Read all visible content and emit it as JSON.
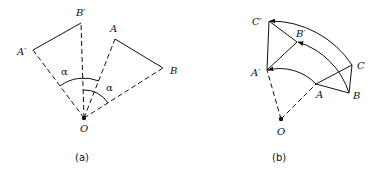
{
  "diagram_a": {
    "caption": "(a)",
    "labels": {
      "O": "O",
      "A": "A",
      "B": "B",
      "A_prime": "A′",
      "B_prime": "B′",
      "alpha_outer": "α",
      "alpha_inner": "α"
    }
  },
  "diagram_b": {
    "caption": "(b)",
    "labels": {
      "O": "O",
      "A": "A",
      "B": "B",
      "C": "C",
      "A_prime": "A′",
      "B_prime": "B′",
      "C_prime": "C′"
    }
  },
  "colors": {
    "stroke": "#111111",
    "background": "#ffffff"
  }
}
